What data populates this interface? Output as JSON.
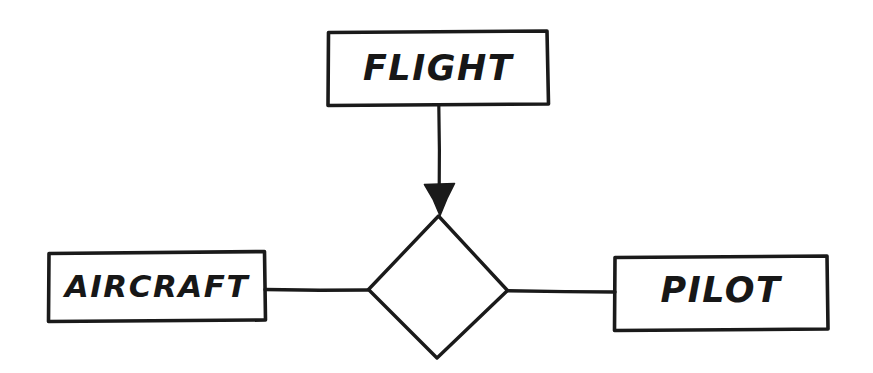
{
  "diagram": {
    "type": "entity-relationship-diagram",
    "style": "hand-drawn sketch, black ink on white paper",
    "background_color": "#ffffff",
    "ink_color": "#1a1a1a",
    "entities": [
      {
        "id": "flight",
        "label": "FLIGHT",
        "shape": "rectangle",
        "position": "top-center"
      },
      {
        "id": "aircraft",
        "label": "AIRCRAFT",
        "shape": "rectangle",
        "position": "middle-left"
      },
      {
        "id": "pilot",
        "label": "PILOT",
        "shape": "rectangle",
        "position": "middle-right"
      }
    ],
    "relationships": [
      {
        "id": "relationship-diamond",
        "label": "",
        "shape": "diamond",
        "position": "center"
      }
    ],
    "connectors": [
      {
        "id": "flight-to-diamond",
        "from": "flight",
        "to": "relationship-diamond",
        "arrowhead": "filled-triangle",
        "arrow_direction": "down",
        "orientation": "vertical"
      },
      {
        "id": "aircraft-to-diamond",
        "from": "aircraft",
        "to": "relationship-diamond",
        "arrowhead": "none",
        "orientation": "horizontal"
      },
      {
        "id": "diamond-to-pilot",
        "from": "relationship-diamond",
        "to": "pilot",
        "arrowhead": "none",
        "orientation": "horizontal"
      }
    ]
  }
}
